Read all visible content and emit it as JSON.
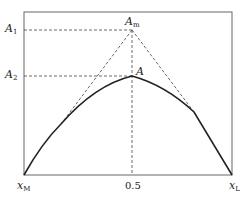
{
  "diagram": {
    "labels": {
      "A1": {
        "main": "A",
        "sub": "1"
      },
      "A2": {
        "main": "A",
        "sub": "2"
      },
      "Am": {
        "main": "A",
        "sub": "m"
      },
      "A": {
        "main": "A",
        "sub": ""
      },
      "xM": {
        "main": "x",
        "sub": "M"
      },
      "xL": {
        "main": "x",
        "sub": "L"
      },
      "mid": "0.5"
    },
    "colors": {
      "frame": "#555555",
      "curve": "#222222",
      "dashed": "#444444"
    }
  }
}
